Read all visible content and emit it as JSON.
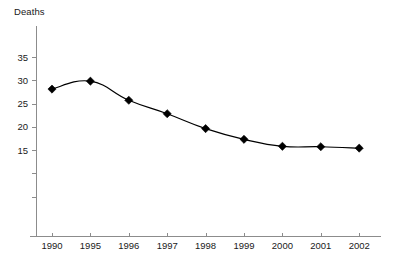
{
  "chart_data": {
    "type": "line",
    "title": "",
    "subtitle": "",
    "xlabel": "",
    "ylabel": "Deaths",
    "categories": [
      "1990",
      "1995",
      "1996",
      "1997",
      "1998",
      "1999",
      "2000",
      "2001",
      "2002"
    ],
    "values": [
      28.1,
      29.8,
      25.7,
      22.8,
      19.6,
      17.3,
      15.8,
      15.7,
      15.4
    ],
    "series": [
      {
        "name": "Deaths",
        "values": [
          28.1,
          29.8,
          25.7,
          22.8,
          19.6,
          17.3,
          15.8,
          15.7,
          15.4
        ]
      }
    ],
    "ylim": [
      0,
      40
    ],
    "y_ticks": [
      35,
      30,
      25,
      20,
      15,
      10,
      5
    ],
    "y_tick_labels": [
      "35",
      "30",
      "25",
      "20",
      "15",
      "",
      ""
    ],
    "grid": false,
    "legend": false,
    "legend_position": "none",
    "marker": "diamond",
    "line_color": "#000000",
    "marker_color": "#000000",
    "axis_color": "#8c8c8c",
    "background_color": "#ffffff",
    "annotations": []
  },
  "axes": {
    "y_title": "Deaths"
  }
}
